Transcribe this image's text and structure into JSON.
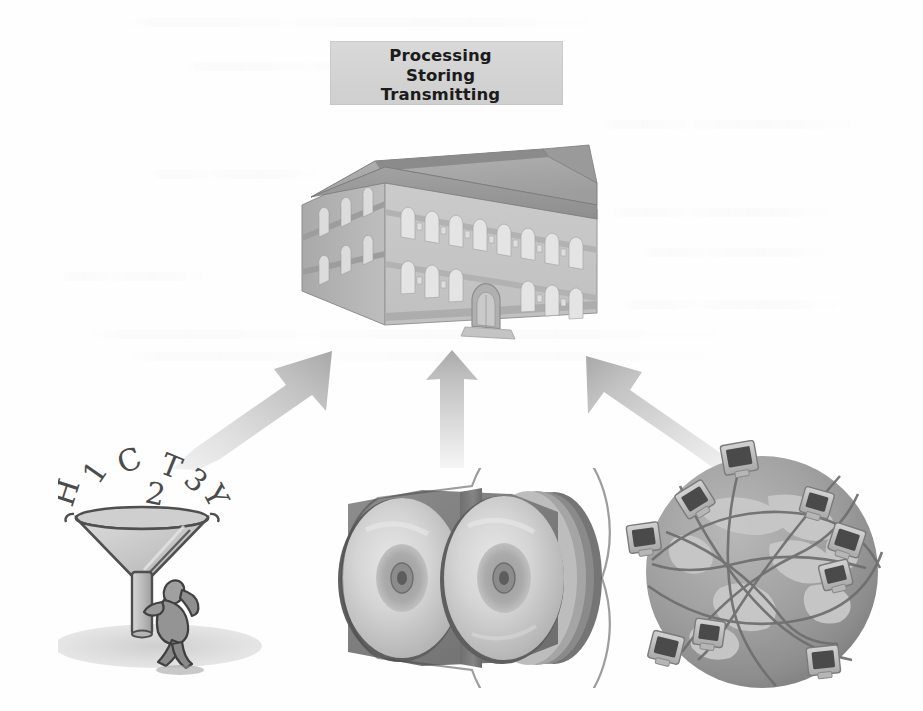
{
  "page": {
    "width": 923,
    "height": 711,
    "background_color": "#fefefe",
    "document_type": "scanned textbook figure",
    "alt_description": "Three data sources feed into a building: collected data, stored discs, and a networked globe"
  },
  "title_banner": {
    "box_color": "#d4d4d4",
    "text_color": "#1b1b1b",
    "lines": [
      "Processing",
      "Storing",
      "Transmitting"
    ]
  },
  "central_figure": {
    "name": "institution-building",
    "description": "Isometric grayscale two-story building with hipped roof and arched entrance",
    "roof_color": "#a8a8a8",
    "facade_color": "#c3c3c3",
    "window_color": "#e2e2e2",
    "floors": 2
  },
  "arrows": [
    {
      "id": "left-arrow",
      "direction": "up-right",
      "from": "data-collection-funnel",
      "to": "institution-building",
      "color": "#b9b9b9"
    },
    {
      "id": "center-arrow",
      "direction": "up",
      "from": "optical-disc-stack",
      "to": "institution-building",
      "color": "#b9b9b9"
    },
    {
      "id": "right-arrow",
      "direction": "up-left",
      "from": "global-network-globe",
      "to": "institution-building",
      "color": "#b9b9b9"
    }
  ],
  "sources": [
    {
      "id": "data-collection-funnel",
      "label": "Data collection funnel",
      "description": "A funnel catching falling characters while a person braces its stem",
      "falling_characters": [
        "H",
        "1",
        "C",
        "2",
        "T",
        "3",
        "Y"
      ],
      "funnel_color": "#c8c8c8",
      "figure_color": "#8f8f8f"
    },
    {
      "id": "optical-disc-stack",
      "label": "Optical disc stack",
      "description": "A stack of CDs/DVDs viewed at an angle, two disc faces visible",
      "disc_count": 5,
      "disc_color": "#d0d0d0",
      "case_color": "#7e7e7e"
    },
    {
      "id": "global-network-globe",
      "label": "Global computer network",
      "description": "A globe ringed with computer monitors joined by network cables",
      "monitor_count": 8,
      "ocean_color": "#9a9a9a",
      "land_color": "#c6c6c6",
      "cable_color": "#6e6e6e",
      "monitor_screen_color": "#4a4a4a"
    }
  ]
}
